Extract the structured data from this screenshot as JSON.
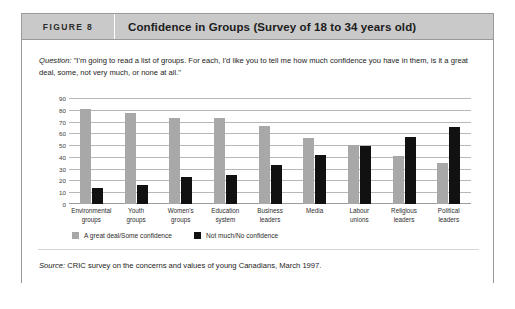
{
  "figure": {
    "number_label": "FIGURE 8",
    "title": "Confidence in Groups (Survey of 18 to 34 years old)"
  },
  "question": {
    "label": "Question:",
    "text": " \"I'm going to read a list of groups. For each, I'd like you to tell me how much confidence you have in them, is it a great deal, some, not very much, or none at all.\""
  },
  "source": {
    "label": "Source:",
    "text": " CRIC survey on the concerns and values of young Canadians, March 1997."
  },
  "colors": {
    "series_a": "#a8a8a8",
    "series_b": "#111111",
    "header_band": "#c9c9c9",
    "frame_border": "#9a9a9a",
    "gridline": "#b7b7b7"
  },
  "chart_data": {
    "type": "bar",
    "title": "Confidence in Groups (Survey of 18 to 34 years old)",
    "xlabel": "",
    "ylabel": "",
    "ylim": [
      0,
      90
    ],
    "yticks": [
      0,
      10,
      20,
      30,
      40,
      50,
      60,
      70,
      80,
      90
    ],
    "grid": true,
    "legend_position": "bottom-left",
    "orientation": "vertical",
    "grouped": true,
    "categories": [
      "Environmental groups",
      "Youth groups",
      "Women's groups",
      "Education system",
      "Business leaders",
      "Media",
      "Labour unions",
      "Religious leaders",
      "Political leaders"
    ],
    "category_lines": [
      [
        "Environmental",
        "groups"
      ],
      [
        "Youth",
        "groups"
      ],
      [
        "Women's",
        "groups"
      ],
      [
        "Education",
        "system"
      ],
      [
        "Business",
        "leaders"
      ],
      [
        "Media",
        ""
      ],
      [
        "Labour",
        "unions"
      ],
      [
        "Religious",
        "leaders"
      ],
      [
        "Political",
        "leaders"
      ]
    ],
    "series": [
      {
        "name": "A great deal/Some confidence",
        "color": "#a8a8a8",
        "values": [
          81,
          77,
          73,
          73,
          66,
          56,
          50,
          41,
          35
        ]
      },
      {
        "name": "Not much/No confidence",
        "color": "#111111",
        "values": [
          14,
          16,
          23,
          25,
          33,
          42,
          49,
          57,
          65
        ]
      }
    ]
  }
}
